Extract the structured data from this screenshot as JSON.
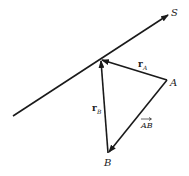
{
  "diagram": {
    "type": "vector-geometry",
    "line": {
      "label": "S",
      "start": [
        13,
        116
      ],
      "end": [
        170,
        14
      ]
    },
    "points": {
      "O": {
        "x": 101,
        "y": 60,
        "label": ""
      },
      "A": {
        "x": 167,
        "y": 80,
        "label": "A"
      },
      "B": {
        "x": 108,
        "y": 153,
        "label": "B"
      }
    },
    "vectors": [
      {
        "name": "r_A",
        "label_main": "r",
        "label_sub": "A",
        "from": "A",
        "to": "O"
      },
      {
        "name": "r_B",
        "label_main": "r",
        "label_sub": "B",
        "from": "B",
        "to": "O"
      },
      {
        "name": "AB",
        "label_main": "AB",
        "from": "A",
        "to": "B",
        "overarrow": true
      }
    ],
    "stroke_color": "#1a1a1a"
  }
}
